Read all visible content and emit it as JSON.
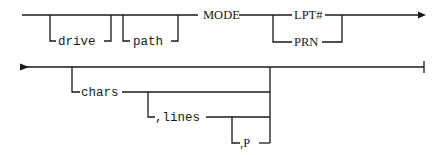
{
  "diagram": {
    "type": "syntax-railroad",
    "row1": {
      "optional_params": [
        {
          "label": "drive"
        },
        {
          "label": "path"
        }
      ],
      "command": "MODE",
      "choice": [
        {
          "label": "LPT#"
        },
        {
          "label": "PRN"
        }
      ],
      "continues": true
    },
    "row2": {
      "optional_params": [
        {
          "label": "chars"
        },
        {
          "label": ",lines"
        },
        {
          "label": ",P"
        }
      ],
      "ends": true
    },
    "colors": {
      "line": "#1a1a1a",
      "background": "#ffffff"
    }
  }
}
